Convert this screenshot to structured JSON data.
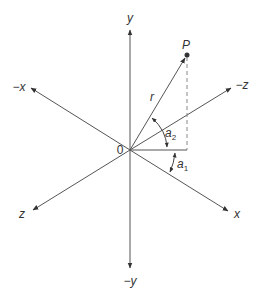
{
  "diagram": {
    "type": "3d-coordinate-axes",
    "colors": {
      "line": "#555555",
      "text": "#333333",
      "dashed": "#888888",
      "background": "#ffffff"
    },
    "origin": {
      "label": "0",
      "x": 130,
      "y": 150
    },
    "axes": [
      {
        "id": "y-pos",
        "label": "y",
        "tip": [
          130,
          28
        ],
        "label_pos": [
          130,
          22
        ]
      },
      {
        "id": "y-neg",
        "label": "−y",
        "tip": [
          130,
          268
        ],
        "label_pos": [
          130,
          284
        ]
      },
      {
        "id": "x-neg",
        "label": "−x",
        "tip": [
          30,
          88
        ],
        "label_pos": [
          17,
          90
        ]
      },
      {
        "id": "x-pos",
        "label": "x",
        "tip": [
          229,
          211
        ],
        "label_pos": [
          236,
          217
        ]
      },
      {
        "id": "z-neg",
        "label": "−z",
        "tip": [
          232,
          87
        ],
        "label_pos": [
          241,
          88
        ]
      },
      {
        "id": "z-pos",
        "label": "z",
        "tip": [
          32,
          211
        ],
        "label_pos": [
          22,
          217
        ]
      }
    ],
    "point": {
      "label": "P",
      "x": 187,
      "y": 55,
      "label_pos": [
        186,
        48
      ]
    },
    "vector": {
      "label": "r",
      "label_pos": [
        152,
        99
      ]
    },
    "angles": [
      {
        "label": "a",
        "subscript": "2",
        "label_pos": [
          166,
          138
        ]
      },
      {
        "label": "a",
        "subscript": "1",
        "label_pos": [
          178,
          169
        ]
      }
    ]
  }
}
